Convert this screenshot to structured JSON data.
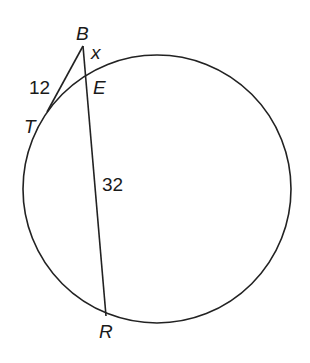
{
  "diagram": {
    "type": "circle-tangent-secant",
    "stroke_color": "#222222",
    "circle": {
      "cx": 157,
      "cy": 189,
      "r": 134
    },
    "points": {
      "B": {
        "label": "B",
        "x": 83,
        "y": 46
      },
      "T": {
        "label": "T",
        "x": 52,
        "y": 106
      },
      "E": {
        "label": "E",
        "x": 88,
        "y": 74
      },
      "R": {
        "label": "R",
        "x": 106,
        "y": 315
      }
    },
    "segments": [
      {
        "from": "B",
        "to": "T",
        "label": "12"
      },
      {
        "from": "B",
        "to": "E",
        "label": "x"
      },
      {
        "from": "E",
        "to": "R",
        "label": "32"
      }
    ],
    "labels": {
      "B": "B",
      "T": "T",
      "E": "E",
      "R": "R",
      "BT": "12",
      "BE": "x",
      "ER": "32"
    }
  }
}
